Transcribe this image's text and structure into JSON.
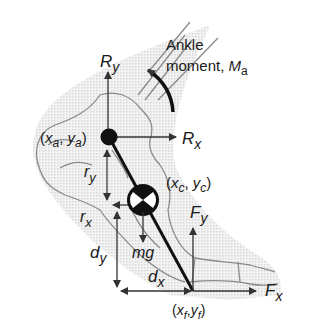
{
  "diagram": {
    "labels": {
      "ry_force": {
        "main": "R",
        "sub": "y"
      },
      "rx_force": {
        "main": "R",
        "sub": "x"
      },
      "ankle_moment_line1": "Ankle",
      "ankle_moment_line2": "moment, ",
      "ankle_moment_symbol": {
        "main": "M",
        "sub": "a"
      },
      "ankle_coord": {
        "open": "(",
        "x": "x",
        "xsub": "a",
        "sep": ", ",
        "y": "y",
        "ysub": "a",
        "close": ")"
      },
      "com_coord": {
        "open": "(",
        "x": "x",
        "xsub": "c",
        "sep": ", ",
        "y": "y",
        "ysub": "c",
        "close": ")"
      },
      "foot_coord": {
        "open": "(",
        "x": "x",
        "xsub": "f",
        "sep": ",",
        "y": "y",
        "ysub": "f",
        "close": ")"
      },
      "r_y": {
        "main": "r",
        "sub": "y"
      },
      "r_x": {
        "main": "r",
        "sub": "x"
      },
      "d_y": {
        "main": "d",
        "sub": "y"
      },
      "d_x": {
        "main": "d",
        "sub": "x"
      },
      "mg": "mg",
      "fy_force": {
        "main": "F",
        "sub": "y"
      },
      "fx_force": {
        "main": "F",
        "sub": "x"
      }
    },
    "colors": {
      "ink": "#1a1a1a",
      "bone_outline": "#8a8a8a",
      "shadow": "#e6e6e6",
      "background": "#ffffff"
    }
  }
}
